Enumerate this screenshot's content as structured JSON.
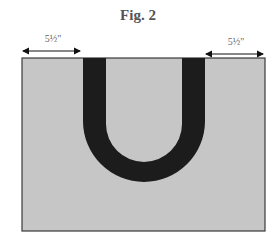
{
  "figure": {
    "title": "Fig. 2"
  },
  "dimensions": {
    "left": {
      "label": "5½\""
    },
    "right": {
      "label": "5½\""
    }
  },
  "colors": {
    "background_panel": "#c6c6c6",
    "u_band": "#1c1c1c",
    "border": "#3a3a3a",
    "arrow": "#111111"
  }
}
